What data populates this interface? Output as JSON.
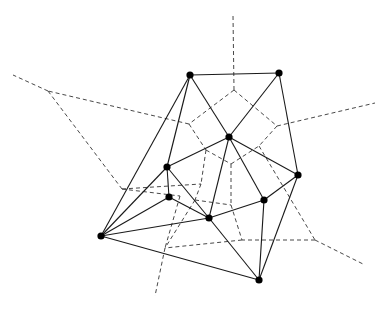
{
  "diagram": {
    "colors": {
      "delaunay": "#1a1a1a",
      "voronoi": "#333333",
      "site": "#000000",
      "background": "#ffffff"
    },
    "sites": {
      "A": [
        190,
        75
      ],
      "B": [
        279,
        73
      ],
      "C": [
        229,
        137
      ],
      "D": [
        167,
        167
      ],
      "E": [
        169,
        197
      ],
      "F": [
        209,
        218
      ],
      "G": [
        264,
        200
      ],
      "H": [
        298,
        175
      ],
      "I": [
        101,
        236
      ],
      "J": [
        259,
        280
      ]
    },
    "delaunay_edges": [
      [
        "A",
        "B"
      ],
      [
        "A",
        "C"
      ],
      [
        "B",
        "C"
      ],
      [
        "B",
        "H"
      ],
      [
        "A",
        "D"
      ],
      [
        "A",
        "I"
      ],
      [
        "C",
        "D"
      ],
      [
        "C",
        "F"
      ],
      [
        "C",
        "G"
      ],
      [
        "C",
        "H"
      ],
      [
        "D",
        "E"
      ],
      [
        "D",
        "F"
      ],
      [
        "D",
        "I"
      ],
      [
        "E",
        "I"
      ],
      [
        "E",
        "F"
      ],
      [
        "F",
        "I"
      ],
      [
        "F",
        "G"
      ],
      [
        "F",
        "J"
      ],
      [
        "G",
        "H"
      ],
      [
        "G",
        "J"
      ],
      [
        "H",
        "J"
      ],
      [
        "I",
        "J"
      ]
    ],
    "voronoi_vertices": {
      "v1": [
        234,
        90
      ],
      "v2": [
        277,
        126
      ],
      "v3": [
        189,
        124
      ],
      "v4": [
        206,
        150
      ],
      "v5": [
        231,
        164
      ],
      "v6": [
        259,
        146
      ],
      "v7": [
        122,
        189
      ],
      "v8": [
        201,
        184
      ],
      "v9": [
        180,
        196
      ],
      "v10": [
        242,
        240
      ],
      "v11": [
        315,
        240
      ],
      "v12": [
        165,
        248
      ],
      "v13": [
        195,
        200
      ],
      "v14": [
        231,
        205
      ],
      "o1": [
        233,
        15
      ],
      "o2": [
        375,
        103
      ],
      "o3": [
        13,
        75
      ],
      "o4": [
        48,
        91
      ],
      "o5": [
        363,
        264
      ],
      "o6": [
        155,
        296
      ]
    },
    "voronoi_edges": [
      [
        "v1",
        "o1"
      ],
      [
        "v1",
        "v3"
      ],
      [
        "v1",
        "v2"
      ],
      [
        "v2",
        "o2"
      ],
      [
        "v2",
        "v6"
      ],
      [
        "v3",
        "v4"
      ],
      [
        "v3",
        "o4"
      ],
      [
        "o4",
        "o3"
      ],
      [
        "o4",
        "v7"
      ],
      [
        "v7",
        "v8"
      ],
      [
        "v4",
        "v5"
      ],
      [
        "v4",
        "v8"
      ],
      [
        "v5",
        "v6"
      ],
      [
        "v6",
        "v11"
      ],
      [
        "v11",
        "o5"
      ],
      [
        "v11",
        "v10"
      ],
      [
        "v5",
        "v14"
      ],
      [
        "v14",
        "v10"
      ],
      [
        "v8",
        "v13"
      ],
      [
        "v13",
        "v14"
      ],
      [
        "v7",
        "v9"
      ],
      [
        "v9",
        "v12"
      ],
      [
        "v13",
        "v12"
      ],
      [
        "v12",
        "o6"
      ],
      [
        "v10",
        "v12"
      ]
    ]
  }
}
